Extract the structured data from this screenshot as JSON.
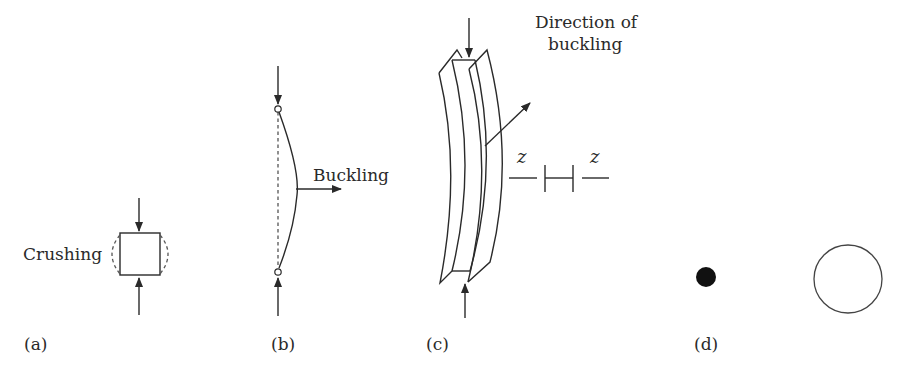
{
  "figure": {
    "panels": [
      {
        "id": "a",
        "label": "(a)",
        "annotation": "Crushing"
      },
      {
        "id": "b",
        "label": "(b)",
        "annotation": "Buckling"
      },
      {
        "id": "c",
        "label": "(c)",
        "annotation_line1": "Direction of",
        "annotation_line2": "buckling",
        "axis_left": "z",
        "axis_right": "z"
      },
      {
        "id": "d",
        "label": "(d)"
      }
    ],
    "colors": {
      "line": "#2a2a2a",
      "dashed": "#555555",
      "fill_dot": "#111111",
      "background": "#ffffff"
    }
  }
}
